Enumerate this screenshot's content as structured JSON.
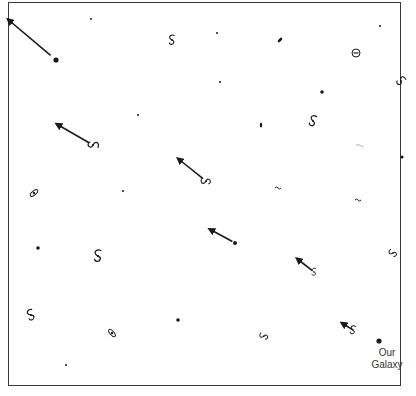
{
  "diagram": {
    "title": "",
    "frame": {
      "x": 8,
      "y": 2,
      "width": 393,
      "height": 384
    },
    "colors": {
      "ink": "#1a1a1a",
      "frame": "#3a3a3a",
      "background": "#ffffff"
    },
    "observer": {
      "x": 379,
      "y": 341,
      "label_line1": "Our",
      "label_line2": "Galaxy"
    },
    "galaxies": [
      {
        "type": "dot",
        "x": 56,
        "y": 60,
        "r": 2.6,
        "arrow": {
          "x2": 11,
          "y2": 22
        }
      },
      {
        "type": "speck",
        "x": 91,
        "y": 19
      },
      {
        "type": "spiral",
        "x": 172,
        "y": 40,
        "rot": 0,
        "s": 0.9
      },
      {
        "type": "speck",
        "x": 217,
        "y": 33
      },
      {
        "type": "elongated",
        "x": 280,
        "y": 40,
        "rot": -45
      },
      {
        "type": "speck",
        "x": 380,
        "y": 26
      },
      {
        "type": "ring",
        "x": 356,
        "y": 53
      },
      {
        "type": "spiral",
        "x": 401,
        "y": 81,
        "rot": 45,
        "s": 0.9
      },
      {
        "type": "speck",
        "x": 220,
        "y": 82
      },
      {
        "type": "dot",
        "x": 322,
        "y": 92,
        "r": 1.8
      },
      {
        "type": "speck",
        "x": 138,
        "y": 115
      },
      {
        "type": "edge",
        "x": 261,
        "y": 125
      },
      {
        "type": "spiral",
        "x": 313,
        "y": 121,
        "rot": 15,
        "s": 1.0
      },
      {
        "type": "spiral",
        "x": 93,
        "y": 145,
        "rot": 90,
        "s": 1.0,
        "arrow": {
          "x2": 60,
          "y2": 126
        }
      },
      {
        "type": "faint",
        "x": 360,
        "y": 146
      },
      {
        "type": "dot",
        "x": 402,
        "y": 157,
        "r": 1.6
      },
      {
        "type": "spiral",
        "x": 206,
        "y": 181,
        "rot": -90,
        "s": 0.9,
        "arrow": {
          "x2": 181,
          "y2": 161
        }
      },
      {
        "type": "speck",
        "x": 123,
        "y": 191
      },
      {
        "type": "small",
        "x": 278,
        "y": 188
      },
      {
        "type": "small",
        "x": 358,
        "y": 200
      },
      {
        "type": "ellipse",
        "x": 34,
        "y": 193,
        "rot": -40
      },
      {
        "type": "dot",
        "x": 235,
        "y": 243,
        "r": 2.0,
        "arrow": {
          "x2": 213,
          "y2": 231
        }
      },
      {
        "type": "dot",
        "x": 38,
        "y": 248,
        "r": 1.8
      },
      {
        "type": "spiral",
        "x": 98,
        "y": 256,
        "rot": 0,
        "s": 1.1
      },
      {
        "type": "spiral",
        "x": 393,
        "y": 253,
        "rot": -60,
        "s": 0.8
      },
      {
        "type": "spiral",
        "x": 314,
        "y": 272,
        "rot": 0,
        "s": 0.7,
        "arrow": {
          "x2": 300,
          "y2": 261
        }
      },
      {
        "type": "spiral",
        "x": 31,
        "y": 315,
        "rot": -20,
        "s": 1.0
      },
      {
        "type": "ellipse",
        "x": 112,
        "y": 333,
        "rot": 50
      },
      {
        "type": "dot",
        "x": 178,
        "y": 320,
        "r": 1.8
      },
      {
        "type": "spiral",
        "x": 264,
        "y": 336,
        "rot": -70,
        "s": 0.8
      },
      {
        "type": "spiral",
        "x": 353,
        "y": 330,
        "rot": 10,
        "s": 0.8,
        "arrow": {
          "x2": 345,
          "y2": 325
        }
      },
      {
        "type": "speck",
        "x": 66,
        "y": 365
      }
    ]
  }
}
